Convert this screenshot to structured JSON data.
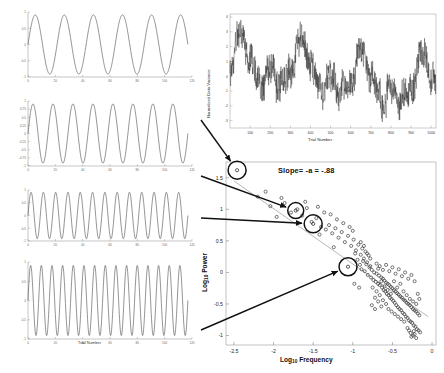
{
  "figure": {
    "background": "#ffffff",
    "line_color": "#333333",
    "arrow_color": "#1a1a1a",
    "marker_color": "#2b2b2b"
  },
  "signal_panels": [
    {
      "name": "panel-1-slow-sine",
      "cycles": 5.5,
      "amplitude": 1.0,
      "yticks": [
        "1",
        "0.5",
        "0",
        "-0.5",
        "-1"
      ],
      "xticks": [
        "0",
        "20",
        "40",
        "60",
        "80",
        "100",
        "120"
      ],
      "xlabel": "Trial Number",
      "ylabel": ""
    },
    {
      "name": "panel-2-medium-sine",
      "cycles": 8.0,
      "amplitude": 1.0,
      "yticks": [
        "1",
        "0.75",
        "0.5",
        "0.25",
        "0",
        "-0.25",
        "-0.5",
        "-0.75",
        "-1"
      ],
      "xticks": [
        "0",
        "20",
        "40",
        "60",
        "80",
        "100",
        "120"
      ],
      "xlabel": "Trial Number",
      "ylabel": ""
    },
    {
      "name": "panel-3-fast-sine",
      "cycles": 13.0,
      "amplitude": 1.0,
      "yticks": [
        "1",
        "0.5",
        "0",
        "-0.5",
        "-1"
      ],
      "xticks": [
        "0",
        "20",
        "40",
        "60",
        "80",
        "100",
        "120"
      ],
      "xlabel": "Trial Number",
      "ylabel": ""
    },
    {
      "name": "panel-4-fastest-sine",
      "cycles": 15.0,
      "amplitude": 1.0,
      "yticks": [
        "1",
        "0.5",
        "0",
        "-0.5",
        "-1"
      ],
      "xticks": [
        "0",
        "20",
        "40",
        "60",
        "80",
        "100",
        "120"
      ],
      "xlabel": "Trial Number",
      "ylabel": ""
    }
  ],
  "timeseries": {
    "title": "",
    "xlabel": "Trial Number",
    "ylabel": "Normalized Data Variance",
    "xticks": [
      "100",
      "200",
      "300",
      "400",
      "500",
      "600",
      "700",
      "800",
      "900",
      "1000"
    ],
    "yticks": [
      "4",
      "3",
      "2",
      "1",
      "0",
      "-1",
      "-2",
      "-3"
    ],
    "xlim": [
      0,
      1024
    ],
    "ylim": [
      -3.5,
      4.2
    ],
    "n_points": 1024
  },
  "chart_data": {
    "type": "scatter",
    "title": "",
    "annotation": "Slope= -a = -.88",
    "slope_value": -0.88,
    "xlabel": "Log10 Frequency",
    "xlabel_base": "Log",
    "xlabel_sub": "10",
    "xlabel_rest": " Frequency",
    "ylabel": "Log10 Power",
    "ylabel_base": "Log",
    "ylabel_sub": "10",
    "ylabel_rest": " Power",
    "xticks": [
      "-2.5",
      "-2",
      "-1.5",
      "-1",
      "-0.5",
      "0"
    ],
    "yticks": [
      "1.5",
      "1",
      "0.5",
      "0",
      "-0.5",
      "-1"
    ],
    "xlim": [
      -2.6,
      0.05
    ],
    "ylim": [
      -1.15,
      1.75
    ],
    "grid": false,
    "legend": null,
    "fit_line": {
      "x": [
        -2.5,
        -0.05
      ],
      "y": [
        1.45,
        -0.7
      ],
      "slope": -0.88
    },
    "highlighted": [
      {
        "label": "a",
        "x": -2.46,
        "y": 1.62,
        "r": 9
      },
      {
        "label": "b",
        "x": -1.72,
        "y": 0.98,
        "r": 8
      },
      {
        "label": "c",
        "x": -1.5,
        "y": 0.77,
        "r": 9
      },
      {
        "label": "d",
        "x": -1.06,
        "y": 0.09,
        "r": 9
      }
    ],
    "points": [
      [
        -2.2,
        1.2
      ],
      [
        -2.04,
        1.05
      ],
      [
        -1.96,
        0.88
      ],
      [
        -1.86,
        1.1
      ],
      [
        -1.78,
        0.95
      ],
      [
        -1.7,
        1.0
      ],
      [
        -1.64,
        0.9
      ],
      [
        -1.58,
        1.02
      ],
      [
        -1.52,
        0.8
      ],
      [
        -1.46,
        0.86
      ],
      [
        -1.4,
        0.72
      ],
      [
        -1.36,
        0.95
      ],
      [
        -1.44,
        1.04
      ],
      [
        -1.34,
        0.68
      ],
      [
        -1.3,
        0.75
      ],
      [
        -1.26,
        0.62
      ],
      [
        -1.22,
        0.7
      ],
      [
        -1.18,
        0.55
      ],
      [
        -1.14,
        0.64
      ],
      [
        -1.1,
        0.48
      ],
      [
        -1.06,
        0.58
      ],
      [
        -1.02,
        0.42
      ],
      [
        -0.99,
        0.52
      ],
      [
        -0.96,
        0.35
      ],
      [
        -0.93,
        0.44
      ],
      [
        -0.9,
        0.28
      ],
      [
        -0.88,
        0.38
      ],
      [
        -0.86,
        0.22
      ],
      [
        -0.84,
        0.33
      ],
      [
        -0.82,
        0.16
      ],
      [
        -0.8,
        0.27
      ],
      [
        -0.78,
        0.1
      ],
      [
        -0.97,
        0.3
      ],
      [
        -0.94,
        0.2
      ],
      [
        -0.91,
        0.12
      ],
      [
        -0.89,
        0.05
      ],
      [
        -0.87,
        0.18
      ],
      [
        -0.85,
        0.02
      ],
      [
        -0.83,
        0.13
      ],
      [
        -0.81,
        -0.04
      ],
      [
        -0.79,
        0.08
      ],
      [
        -0.77,
        -0.08
      ],
      [
        -0.76,
        0.04
      ],
      [
        -0.74,
        -0.12
      ],
      [
        -0.73,
        0.0
      ],
      [
        -0.71,
        -0.15
      ],
      [
        -0.7,
        -0.02
      ],
      [
        -0.68,
        -0.18
      ],
      [
        -0.67,
        -0.05
      ],
      [
        -0.66,
        -0.2
      ],
      [
        -0.64,
        -0.08
      ],
      [
        -0.63,
        -0.24
      ],
      [
        -0.62,
        -0.1
      ],
      [
        -0.61,
        -0.28
      ],
      [
        -0.6,
        -0.13
      ],
      [
        -0.59,
        -0.3
      ],
      [
        -0.58,
        -0.16
      ],
      [
        -0.57,
        -0.34
      ],
      [
        -0.56,
        -0.18
      ],
      [
        -0.55,
        -0.36
      ],
      [
        -0.54,
        -0.2
      ],
      [
        -0.53,
        -0.4
      ],
      [
        -0.52,
        -0.23
      ],
      [
        -0.51,
        -0.42
      ],
      [
        -0.5,
        -0.25
      ],
      [
        -0.49,
        -0.45
      ],
      [
        -0.48,
        -0.28
      ],
      [
        -0.47,
        -0.48
      ],
      [
        -0.46,
        -0.3
      ],
      [
        -0.45,
        -0.52
      ],
      [
        -0.44,
        -0.33
      ],
      [
        -0.43,
        -0.55
      ],
      [
        -0.42,
        -0.35
      ],
      [
        -0.41,
        -0.58
      ],
      [
        -0.4,
        -0.38
      ],
      [
        -0.39,
        -0.6
      ],
      [
        -0.38,
        -0.4
      ],
      [
        -0.37,
        -0.64
      ],
      [
        -0.36,
        -0.43
      ],
      [
        -0.35,
        -0.66
      ],
      [
        -0.34,
        -0.45
      ],
      [
        -0.33,
        -0.7
      ],
      [
        -0.32,
        -0.48
      ],
      [
        -0.31,
        -0.72
      ],
      [
        -0.3,
        -0.5
      ],
      [
        -0.29,
        -0.76
      ],
      [
        -0.28,
        -0.52
      ],
      [
        -0.27,
        -0.78
      ],
      [
        -0.26,
        -0.55
      ],
      [
        -0.25,
        -0.8
      ],
      [
        -0.24,
        -0.58
      ],
      [
        -0.23,
        -0.84
      ],
      [
        -0.22,
        -0.6
      ],
      [
        -0.21,
        -0.86
      ],
      [
        -0.2,
        -0.62
      ],
      [
        -0.19,
        -0.9
      ],
      [
        -0.18,
        -0.65
      ],
      [
        -0.17,
        -0.92
      ],
      [
        -0.16,
        -0.68
      ],
      [
        -0.15,
        -0.95
      ],
      [
        -0.66,
        0.1
      ],
      [
        -0.62,
        0.04
      ],
      [
        -0.58,
        0.12
      ],
      [
        -0.54,
        0.02
      ],
      [
        -0.5,
        0.08
      ],
      [
        -0.46,
        -0.02
      ],
      [
        -0.42,
        0.05
      ],
      [
        -0.38,
        -0.06
      ],
      [
        -0.34,
        0.0
      ],
      [
        -0.3,
        -0.1
      ],
      [
        -0.26,
        -0.04
      ],
      [
        -0.22,
        -0.14
      ],
      [
        -0.7,
        0.14
      ],
      [
        -0.68,
        0.06
      ],
      [
        -0.64,
        -0.14
      ],
      [
        -0.6,
        -0.22
      ],
      [
        -0.56,
        -0.28
      ],
      [
        -0.52,
        -0.34
      ],
      [
        -0.48,
        -0.14
      ],
      [
        -0.44,
        -0.24
      ],
      [
        -0.4,
        -0.18
      ],
      [
        -0.36,
        -0.3
      ],
      [
        -0.32,
        -0.36
      ],
      [
        -0.28,
        -0.42
      ],
      [
        -0.24,
        -0.46
      ],
      [
        -0.2,
        -0.5
      ],
      [
        -0.18,
        -0.34
      ],
      [
        -0.16,
        -0.42
      ],
      [
        -0.31,
        -0.88
      ],
      [
        -0.29,
        -0.92
      ],
      [
        -0.27,
        -0.96
      ],
      [
        -0.24,
        -1.0
      ],
      [
        -0.22,
        -0.98
      ],
      [
        -0.26,
        -1.02
      ],
      [
        -0.2,
        -1.04
      ],
      [
        -0.23,
        -0.93
      ],
      [
        -0.62,
        -0.44
      ],
      [
        -0.58,
        -0.5
      ],
      [
        -0.66,
        -0.36
      ],
      [
        -0.7,
        -0.3
      ],
      [
        -0.75,
        -0.24
      ],
      [
        -0.72,
        -0.4
      ],
      [
        -0.68,
        -0.46
      ],
      [
        -0.64,
        -0.54
      ],
      [
        -0.55,
        -0.58
      ],
      [
        -0.51,
        -0.62
      ],
      [
        -0.47,
        -0.66
      ],
      [
        -0.43,
        -0.7
      ],
      [
        -0.39,
        -0.74
      ],
      [
        -0.35,
        -0.78
      ],
      [
        -0.78,
        0.22
      ],
      [
        -0.82,
        0.3
      ],
      [
        -0.86,
        0.42
      ],
      [
        -0.9,
        0.48
      ],
      [
        -1.0,
        0.66
      ],
      [
        -1.04,
        0.72
      ],
      [
        -1.12,
        0.78
      ],
      [
        -1.2,
        0.84
      ],
      [
        -1.28,
        0.92
      ],
      [
        -1.6,
        1.12
      ],
      [
        -1.9,
        1.18
      ],
      [
        -2.1,
        1.28
      ],
      [
        -1.42,
        0.6
      ],
      [
        -1.24,
        0.4
      ],
      [
        -0.98,
        -0.18
      ],
      [
        -0.92,
        -0.24
      ],
      [
        -0.76,
        -0.52
      ],
      [
        -0.72,
        -0.58
      ]
    ]
  },
  "callouts": [
    {
      "from_panel": 0,
      "to_point": "a"
    },
    {
      "from_panel": 1,
      "to_point": "b"
    },
    {
      "from_panel": 2,
      "to_point": "c"
    },
    {
      "from_panel": 3,
      "to_point": "d"
    }
  ]
}
